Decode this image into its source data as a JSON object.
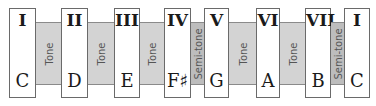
{
  "diagram": {
    "notes": [
      {
        "degree": "I",
        "name": "C"
      },
      {
        "degree": "II",
        "name": "D"
      },
      {
        "degree": "III",
        "name": "E"
      },
      {
        "degree": "IV",
        "name": "F♯"
      },
      {
        "degree": "V",
        "name": "G"
      },
      {
        "degree": "VI",
        "name": "A"
      },
      {
        "degree": "VII",
        "name": "B"
      },
      {
        "degree": "I",
        "name": "C"
      }
    ],
    "intervals": [
      {
        "label": "Tone",
        "type": "tone"
      },
      {
        "label": "Tone",
        "type": "tone"
      },
      {
        "label": "Tone",
        "type": "tone"
      },
      {
        "label": "Semi-tone",
        "type": "semitone"
      },
      {
        "label": "Tone",
        "type": "tone"
      },
      {
        "label": "Tone",
        "type": "tone"
      },
      {
        "label": "Semi-tone",
        "type": "semitone"
      }
    ],
    "colors": {
      "gap_fill": "#d3d3d3",
      "box_border": "#6a6a6a",
      "text": "#1a1a1a"
    }
  }
}
